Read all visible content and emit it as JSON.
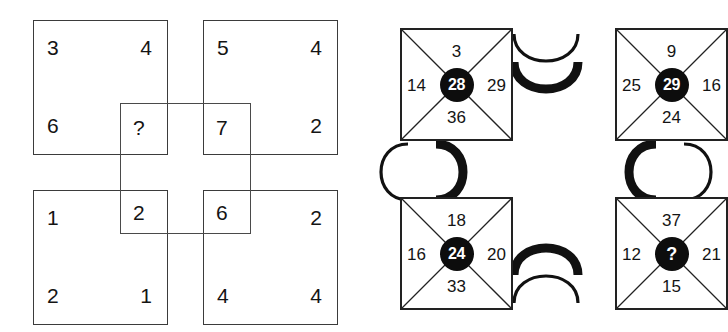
{
  "puzzle": {
    "left": {
      "name": "overlapping-squares-puzzle",
      "squares": [
        {
          "id": "top-left",
          "tl": "3",
          "tr": "4",
          "bl": "6",
          "br": ""
        },
        {
          "id": "top-right",
          "tl": "5",
          "tr": "4",
          "bl": "",
          "br": "2"
        },
        {
          "id": "bottom-left",
          "tl": "1",
          "tr": "",
          "bl": "2",
          "br": "1"
        },
        {
          "id": "bottom-right",
          "tl": "",
          "tr": "2",
          "bl": "4",
          "br": "4"
        }
      ],
      "center_square": {
        "tl": "?",
        "tr": "7",
        "bl": "2",
        "br": "6"
      }
    },
    "right": {
      "name": "linked-x-nodes-puzzle",
      "nodes": [
        {
          "id": "top-left",
          "top": "3",
          "left": "14",
          "right": "29",
          "bottom": "36",
          "center": "28"
        },
        {
          "id": "top-right",
          "top": "9",
          "left": "25",
          "right": "16",
          "bottom": "24",
          "center": "29"
        },
        {
          "id": "bottom-left",
          "top": "18",
          "left": "16",
          "right": "20",
          "bottom": "33",
          "center": "24"
        },
        {
          "id": "bottom-right",
          "top": "37",
          "left": "12",
          "right": "21",
          "bottom": "15",
          "center": "?"
        }
      ],
      "links": [
        {
          "id": "link-top",
          "from": "top-left",
          "to": "top-right"
        },
        {
          "id": "link-right",
          "from": "top-right",
          "to": "bottom-right"
        },
        {
          "id": "link-bottom",
          "from": "bottom-left",
          "to": "bottom-right"
        },
        {
          "id": "link-left",
          "from": "top-left",
          "to": "bottom-left"
        }
      ]
    }
  },
  "colors": {
    "ink": "#141414",
    "line": "#3b3b3b",
    "disc_fill": "#0d0d0d",
    "disc_text": "#ffffff",
    "background": "#ffffff"
  }
}
